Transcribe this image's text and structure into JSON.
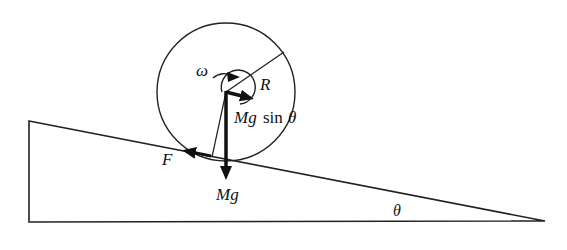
{
  "diagram": {
    "colors": {
      "stroke": "#222222",
      "text": "#111111",
      "background": "#ffffff"
    },
    "labels": {
      "omega": "ω",
      "radius": "R",
      "force_parallel_mg": "Mg",
      "force_parallel_sin": "sin",
      "force_parallel_theta": "θ",
      "friction": "F",
      "weight": "Mg",
      "angle": "θ"
    },
    "elements": [
      {
        "id": "incline",
        "type": "triangle",
        "points": [
          [
            29,
            121
          ],
          [
            545,
            221
          ],
          [
            29,
            222
          ]
        ]
      },
      {
        "id": "wheel",
        "type": "circle",
        "center": [
          226,
          92
        ],
        "radius": 69
      },
      {
        "id": "radius-line",
        "from": [
          226,
          92
        ],
        "to": [
          284,
          52
        ],
        "label": "R"
      },
      {
        "id": "angular-velocity",
        "type": "circular-arrow",
        "label": "ω"
      },
      {
        "id": "force-mg-sin-theta",
        "type": "arrow",
        "direction": "down-slope",
        "label": "Mg sin θ"
      },
      {
        "id": "friction-force",
        "type": "arrow",
        "direction": "up-slope",
        "label": "F"
      },
      {
        "id": "weight-force",
        "type": "arrow",
        "direction": "down",
        "label": "Mg"
      },
      {
        "id": "contact-line",
        "from": [
          226,
          92
        ],
        "to": [
          212,
          157
        ]
      }
    ]
  }
}
